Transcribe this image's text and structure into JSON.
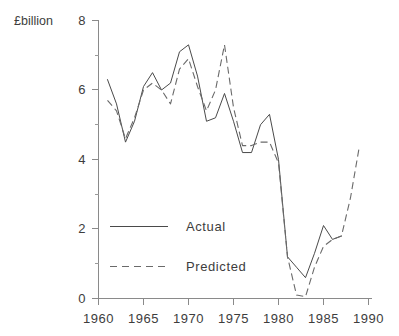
{
  "chart_data": {
    "type": "line",
    "title": "",
    "xlabel": "",
    "ylabel": "£billion",
    "ylabel_position": "top-left",
    "xlim": [
      1960,
      1990
    ],
    "ylim": [
      0,
      8
    ],
    "xticks": [
      1960,
      1965,
      1970,
      1975,
      1980,
      1985,
      1990
    ],
    "xticklabels": [
      "1960",
      "1965",
      "1970",
      "1975",
      "1980",
      "1985",
      "1990"
    ],
    "yticks": [
      0,
      2,
      4,
      6,
      8
    ],
    "yticklabels": [
      "0",
      "2",
      "4",
      "6",
      "8"
    ],
    "yminorticks": [
      1,
      3,
      5,
      7
    ],
    "grid": false,
    "legend_position": "center-left",
    "series": [
      {
        "name": "Actual",
        "style": "solid",
        "color": "#4a4a4a",
        "x": [
          1961,
          1962,
          1963,
          1964,
          1965,
          1966,
          1967,
          1968,
          1969,
          1970,
          1971,
          1972,
          1973,
          1974,
          1975,
          1976,
          1977,
          1978,
          1979,
          1980,
          1981,
          1982,
          1983,
          1984,
          1985,
          1986,
          1987
        ],
        "values": [
          6.3,
          5.6,
          4.5,
          5.1,
          6.1,
          6.5,
          6.0,
          6.2,
          7.1,
          7.3,
          6.4,
          5.1,
          5.2,
          5.9,
          5.1,
          4.2,
          4.2,
          5.0,
          5.3,
          4.0,
          1.2,
          0.9,
          0.6,
          1.3,
          2.1,
          1.7,
          1.8
        ]
      },
      {
        "name": "Predicted",
        "style": "dashed",
        "color": "#6a6a6a",
        "x": [
          1961,
          1962,
          1963,
          1964,
          1965,
          1966,
          1967,
          1968,
          1969,
          1970,
          1971,
          1972,
          1973,
          1974,
          1975,
          1976,
          1977,
          1978,
          1979,
          1980,
          1981,
          1982,
          1983,
          1984,
          1985,
          1986,
          1987,
          1988,
          1989
        ],
        "values": [
          5.7,
          5.4,
          4.6,
          5.2,
          6.0,
          6.2,
          6.0,
          5.6,
          6.6,
          6.9,
          6.1,
          5.4,
          6.0,
          7.3,
          5.5,
          4.4,
          4.4,
          4.5,
          4.5,
          3.9,
          1.2,
          0.1,
          0.05,
          0.9,
          1.5,
          1.7,
          1.8,
          2.9,
          4.4
        ]
      }
    ],
    "legend_entries": [
      {
        "label": "Actual",
        "style": "solid"
      },
      {
        "label": "Predicted",
        "style": "dashed"
      }
    ]
  },
  "axis": {
    "y_axis_title": "£billion"
  }
}
